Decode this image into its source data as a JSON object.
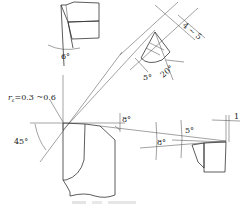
{
  "figure": {
    "type": "cutting-tool-geometry-drawing",
    "labels": {
      "nose_radius": "rε=0.3 ~0.6",
      "nose_radius_symbol": "r",
      "nose_radius_sub": "ε",
      "nose_radius_value": "=0.3 ~0.6",
      "clearance_top_view": "6°",
      "approach_angle": "45°",
      "rake_main": "8°",
      "rake_side": "8°",
      "clearance_side": "5°",
      "land_width": "1",
      "section_clearance": "5°",
      "section_angle": "20°",
      "section_width": "4 ~ 5"
    },
    "caption": ""
  }
}
